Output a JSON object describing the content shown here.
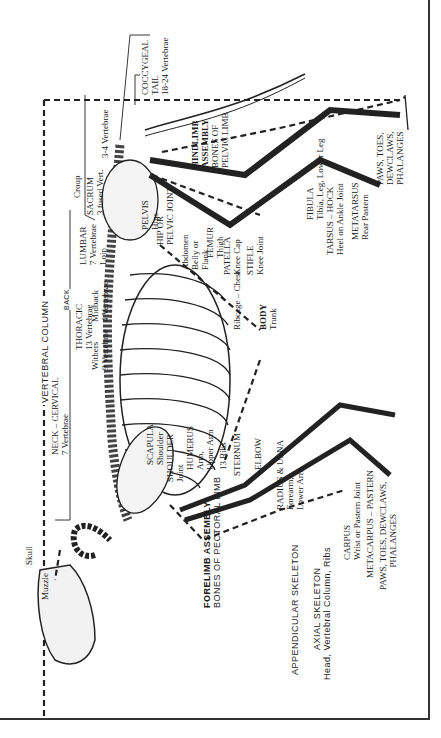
{
  "orientation": "rotated -90deg",
  "labels": {
    "coccygeal": "COCCYGEAL",
    "tail": "TAIL",
    "tail_vert": "18-24 Vertebrae",
    "sacrum_vert": "3-4 Vertebrae",
    "croup": "Croup",
    "sacrum": "SACRUM",
    "sacrum_sub": "3 fused Vert.",
    "hindlimb": "HINDLIMB",
    "assembly": "ASSEMBLY",
    "bones_of": "BONES OF",
    "pelvic_limb": "PELVIC LIMB",
    "paws_rear_1": "PAWS, TOES,",
    "paws_rear_2": "DEWCLAWS,",
    "paws_rear_3": "PHALANGES",
    "pelvis": "PELVIS",
    "hips": "Hips",
    "hip_or": "HIP OR",
    "pelvic_joint": "PELVIC JOINT",
    "fibula": "FIBULA",
    "fibula_sub": "Tibia, Leg, Lower Leg",
    "tarsus": "TARSUS – HOCK",
    "tarsus_sub": "Heel on Ankle Joint",
    "metatarsus": "METATARSUS",
    "metatarsus_sub": "Rear Pastern",
    "lumbar": "LUMBAR",
    "lumbar_sub": "7 Vertebrae",
    "loin": "Loin",
    "abdomen": "Abdomen",
    "belly": "Belly or",
    "flank": "Flank",
    "femur": "FEMUR",
    "thigh": "Thigh",
    "patella": "PATELLA",
    "knee_cap": "Knee Cap",
    "stifle": "STIFLE",
    "knee_joint": "Knee Joint",
    "vertebral_column": "VERTEBRAL COLUMN",
    "back": "BACK",
    "thoracic": "THORACIC",
    "thoracic_sub": "13 Vertebrae",
    "midback": "Midback",
    "midback_sub": "4 Vertebrae",
    "withers": "Withers",
    "withers_sub": "9 Vertebrae",
    "ribcage": "Ribcage – Chest",
    "body": "BODY",
    "trunk": "Trunk",
    "neck": "NECK – CERVICAL",
    "neck_sub": "7 Vertebrae",
    "scapula": "SCAPULA",
    "shoulder": "Shoulder",
    "shoulder_joint": "SHOULDER",
    "joint": "Joint",
    "humerus": "HUMERUS",
    "arm": "Arm,",
    "upper_arm": "Upper Arm",
    "ribs": "13 Ribs",
    "sternum": "STERNUM",
    "elbow": "ELBOW",
    "radius": "RADIUS & ULNA",
    "forearm": "Forearm,",
    "lower_arm": "Lower Arm",
    "carpus": "CARPUS",
    "carpus_sub": "Wrist or Pastern Joint",
    "metacarpus": "METACARPUS – PASTERN",
    "paws_front_1": "PAWS, TOES, DEWCLAWS,",
    "paws_front_2": "PHALANGES",
    "skull": "Skull",
    "muzzle": "Muzzle",
    "forelimb": "FORELIMB ASSEMBLY",
    "pectoral": "BONES OF PECTORAL LIMB",
    "appendicular": "APPENDICULAR SKELETON",
    "axial": "AXIAL SKELETON",
    "axial_sub": "Head, Vertebral Column, Ribs"
  }
}
